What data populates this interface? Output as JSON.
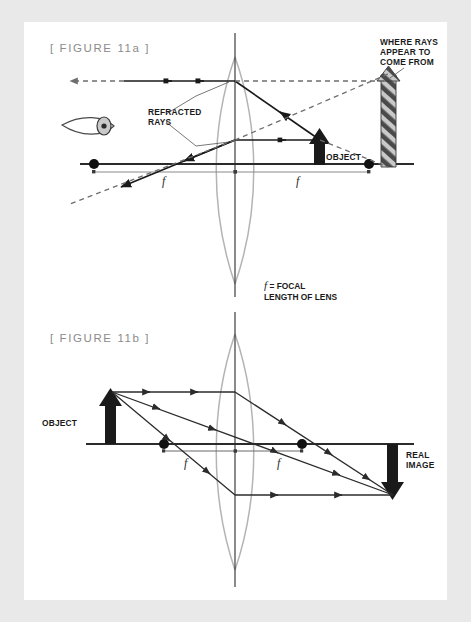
{
  "page": {
    "background_color": "#e9e9e9",
    "card_color": "#ffffff"
  },
  "figures": [
    {
      "id": "figure-11a",
      "label": "[ FIGURE 11a ]",
      "labels": {
        "refracted_rays": "REFRACTED\nRAYS",
        "refracted_rays_line1": "REFRACTED",
        "refracted_rays_line2": "RAYS",
        "where_rays_line1": "WHERE RAYS",
        "where_rays_line2": "APPEAR TO",
        "where_rays_line3": "COME FROM",
        "object": "OBJECT",
        "focal_left": "f",
        "focal_right": "f"
      },
      "icons": [
        "eye-icon",
        "object-arrow-icon",
        "virtual-image-arrow-icon"
      ]
    },
    {
      "id": "figure-11b",
      "label": "[ FIGURE 11b ]",
      "labels": {
        "object": "OBJECT",
        "real_image_line1": "REAL",
        "real_image_line2": "IMAGE",
        "focal_left": "f",
        "focal_right": "f"
      },
      "icons": [
        "object-arrow-icon",
        "real-image-arrow-icon"
      ]
    }
  ],
  "legend": {
    "symbol": "f",
    "equals": "=",
    "line1_rest": "FOCAL",
    "line2": "LENGTH OF LENS"
  },
  "colors": {
    "ink": "#1a1a1a",
    "lens_outline": "#b4b4b4",
    "measure_line": "#8a8a8a",
    "fig_label": "#8c8c8c",
    "stripe_dark": "#4a4a4a",
    "stripe_light": "#c9c9c9"
  }
}
